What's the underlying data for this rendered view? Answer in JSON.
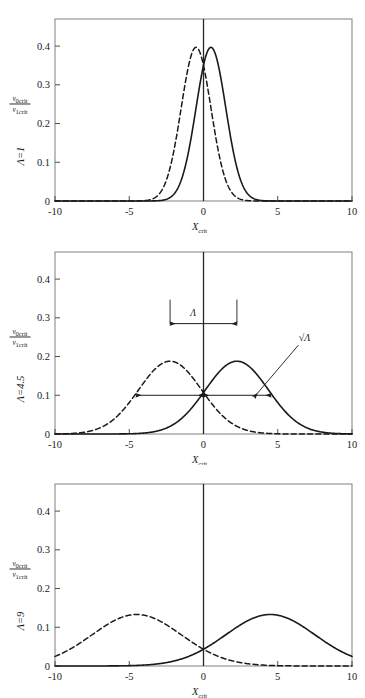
{
  "figure": {
    "title": "",
    "panel_count": 3,
    "axis": {
      "x_label_main": "X",
      "x_label_sub": "crit",
      "y_label_numerator_main": "v",
      "y_label_numerator_sub": "0crit",
      "y_label_denominator_main": "v",
      "y_label_denominator_sub": "1crit",
      "x_ticks": [
        "-10",
        "-5",
        "0",
        "5",
        "10"
      ],
      "x_tick_values": [
        -10,
        -5,
        0,
        5,
        10
      ],
      "y_ticks": [
        "0",
        "0.1",
        "0.2",
        "0.3",
        "0.4"
      ],
      "y_tick_values": [
        0,
        0.1,
        0.2,
        0.3,
        0.4
      ],
      "xlim": [
        -10,
        10
      ],
      "ylim": [
        0,
        0.47
      ]
    },
    "colors": {
      "line": "#1a1a1a",
      "axis": "#4d4d4d",
      "frame": "#808080",
      "background": "#ffffff"
    },
    "annotations": {
      "lambda_symbol": "Λ",
      "sqrt_lambda_symbol": "√Λ"
    }
  },
  "chart_data": [
    {
      "type": "line",
      "panel_index": 0,
      "title": "",
      "lambda_label_prefix": "Λ=",
      "lambda_value": "1",
      "xlabel": "X_crit",
      "ylabel": "v_0crit / v_1crit",
      "xlim": [
        -10,
        10
      ],
      "ylim": [
        0,
        0.47
      ],
      "grid": false,
      "legend": "none",
      "series": [
        {
          "name": "dashed-distribution",
          "style": "dashed",
          "mean": -0.5,
          "sigma": 1.0,
          "amplitude": 0.3969,
          "peak_x": -0.5,
          "peak_y": 0.397
        },
        {
          "name": "solid-distribution",
          "style": "solid",
          "mean": 0.5,
          "sigma": 1.0,
          "amplitude": 0.3969,
          "peak_x": 0.5,
          "peak_y": 0.397
        }
      ]
    },
    {
      "type": "line",
      "panel_index": 1,
      "title": "",
      "lambda_label_prefix": "Λ=",
      "lambda_value": "4.5",
      "xlabel": "X_crit",
      "ylabel": "v_0crit / v_1crit",
      "xlim": [
        -10,
        10
      ],
      "ylim": [
        0,
        0.47
      ],
      "grid": false,
      "legend": "none",
      "series": [
        {
          "name": "dashed-distribution",
          "style": "dashed",
          "mean": -2.25,
          "sigma": 2.121,
          "amplitude": 0.188,
          "peak_x": -2.25,
          "peak_y": 0.188
        },
        {
          "name": "solid-distribution",
          "style": "solid",
          "mean": 2.25,
          "sigma": 2.121,
          "amplitude": 0.188,
          "peak_x": 2.25,
          "peak_y": 0.188
        }
      ],
      "annotations": [
        {
          "name": "lambda-width-arrow",
          "text": "Λ",
          "type": "double-arrow-horizontal",
          "x_from": -2.25,
          "x_to": 2.25,
          "y": 0.285,
          "label_x": -0.7,
          "label_y": 0.305
        },
        {
          "name": "sqrt-lambda-left-arrow",
          "type": "double-arrow-horizontal",
          "x_from": -4.55,
          "x_to": 0,
          "y": 0.1
        },
        {
          "name": "sqrt-lambda-right-arrow",
          "type": "double-arrow-horizontal",
          "x_from": 0,
          "x_to": 4.55,
          "y": 0.1
        },
        {
          "name": "sqrt-lambda-label",
          "text": "√Λ",
          "type": "pointer",
          "label_x": 6.8,
          "label_y": 0.24,
          "point_x": 3.4,
          "point_y": 0.1
        }
      ]
    },
    {
      "type": "line",
      "panel_index": 2,
      "title": "",
      "lambda_label_prefix": "Λ=",
      "lambda_value": "9",
      "xlabel": "X_crit",
      "ylabel": "v_0crit / v_1crit",
      "xlim": [
        -10,
        10
      ],
      "ylim": [
        0,
        0.47
      ],
      "grid": false,
      "legend": "none",
      "series": [
        {
          "name": "dashed-distribution",
          "style": "dashed",
          "mean": -4.5,
          "sigma": 3.0,
          "amplitude": 0.133,
          "peak_x": -4.5,
          "peak_y": 0.131
        },
        {
          "name": "solid-distribution",
          "style": "solid",
          "mean": 4.5,
          "sigma": 3.0,
          "amplitude": 0.133,
          "peak_x": 4.5,
          "peak_y": 0.131
        }
      ]
    }
  ]
}
